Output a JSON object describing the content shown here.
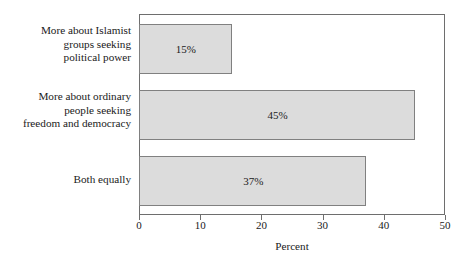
{
  "chart_data": {
    "type": "bar",
    "orientation": "horizontal",
    "title": "",
    "xlabel": "Percent",
    "ylabel": "",
    "xlim": [
      0,
      50
    ],
    "xticks": [
      "0",
      "10",
      "20",
      "30",
      "40",
      "50"
    ],
    "grid": false,
    "legend": false,
    "categories": [
      "More about Islamist groups seeking political power",
      "More about ordinary people seeking freedom and democracy",
      "Both equally"
    ],
    "category_lines": [
      [
        "More about Islamist",
        "groups seeking",
        "political power"
      ],
      [
        "More about ordinary",
        "people seeking",
        "freedom and democracy"
      ],
      [
        "Both equally"
      ]
    ],
    "values": [
      15,
      45,
      37
    ],
    "value_labels": [
      "15%",
      "45%",
      "37%"
    ],
    "colors": {
      "bar_fill": "#dcdcdc",
      "bar_border": "#808080",
      "frame": "#6e6e6e",
      "text": "#1a1a1a",
      "background": "#ffffff"
    }
  }
}
